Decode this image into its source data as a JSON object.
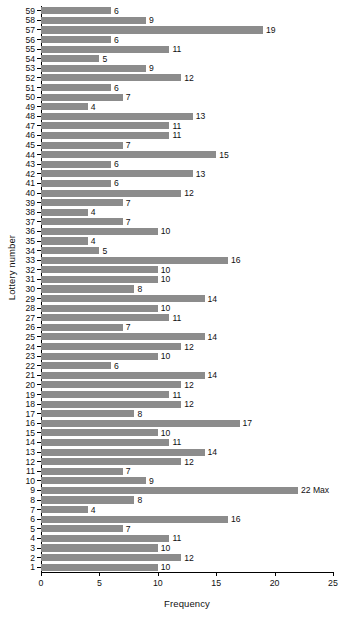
{
  "chart_data": {
    "type": "bar",
    "orientation": "horizontal",
    "title": "",
    "xlabel": "Frequency",
    "ylabel": "Lottery number",
    "xlim": [
      0,
      25
    ],
    "xticks": [
      0,
      5,
      10,
      15,
      20,
      25
    ],
    "grid": false,
    "legend": null,
    "bar_color": "#8c8c8c",
    "categories": [
      59,
      58,
      57,
      56,
      55,
      54,
      53,
      52,
      51,
      50,
      49,
      48,
      47,
      46,
      45,
      44,
      43,
      42,
      41,
      40,
      39,
      38,
      37,
      36,
      35,
      34,
      33,
      32,
      31,
      30,
      29,
      28,
      27,
      26,
      25,
      24,
      23,
      22,
      21,
      20,
      19,
      18,
      17,
      16,
      15,
      14,
      13,
      12,
      11,
      10,
      9,
      8,
      7,
      6,
      5,
      4,
      3,
      2,
      1
    ],
    "values": [
      6,
      9,
      19,
      6,
      11,
      5,
      9,
      12,
      6,
      7,
      4,
      13,
      11,
      11,
      7,
      15,
      6,
      13,
      6,
      12,
      7,
      4,
      7,
      10,
      4,
      5,
      16,
      10,
      10,
      8,
      14,
      10,
      11,
      7,
      14,
      12,
      10,
      6,
      14,
      12,
      11,
      12,
      8,
      17,
      10,
      11,
      14,
      12,
      7,
      9,
      22,
      8,
      4,
      16,
      7,
      11,
      10,
      12,
      10
    ],
    "data_labels": [
      "6",
      "9",
      "19",
      "6",
      "11",
      "5",
      "9",
      "12",
      "6",
      "7",
      "4",
      "13",
      "11",
      "11",
      "7",
      "15",
      "6",
      "13",
      "6",
      "12",
      "7",
      "4",
      "7",
      "10",
      "4",
      "5",
      "16",
      "10",
      "10",
      "8",
      "14",
      "10",
      "11",
      "7",
      "14",
      "12",
      "10",
      "6",
      "14",
      "12",
      "11",
      "12",
      "8",
      "17",
      "10",
      "11",
      "14",
      "12",
      "7",
      "9",
      "22 Max",
      "8",
      "4",
      "16",
      "7",
      "11",
      "10",
      "12",
      "10"
    ],
    "annotations": [
      {
        "category": 9,
        "text": "Max",
        "note": "maximum frequency annotated next to value 22"
      }
    ]
  }
}
